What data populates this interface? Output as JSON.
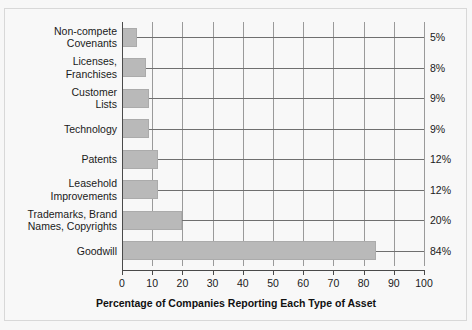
{
  "chart_data": {
    "type": "bar",
    "orientation": "horizontal",
    "title": "",
    "xlabel": "Percentage of Companies Reporting Each Type of Asset",
    "ylabel": "",
    "xlim": [
      0,
      100
    ],
    "xticks": [
      0,
      10,
      20,
      30,
      40,
      50,
      60,
      70,
      80,
      90,
      100
    ],
    "xtick_labels": [
      "0",
      "10",
      "20",
      "30",
      "40",
      "50",
      "60",
      "70",
      "80",
      "90",
      "100"
    ],
    "grid": "vertical",
    "legend": "none",
    "categories": [
      "Non-compete\nCovenants",
      "Licenses,\nFranchises",
      "Customer\nLists",
      "Technology",
      "Patents",
      "Leasehold\nImprovements",
      "Trademarks, Brand\nNames, Copyrights",
      "Goodwill"
    ],
    "values": [
      5,
      8,
      9,
      9,
      12,
      12,
      20,
      84
    ],
    "value_labels": [
      "5%",
      "8%",
      "9%",
      "9%",
      "12%",
      "12%",
      "20%",
      "84%"
    ],
    "bar_color": "#b9b9b9",
    "grid_color": "#9a9a9a",
    "axis_color": "#4a4a4a",
    "background": "#f8f8f8"
  }
}
